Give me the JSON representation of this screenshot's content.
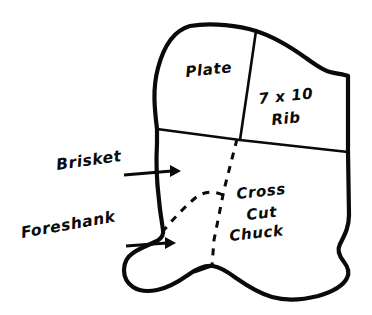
{
  "diagram": {
    "type": "butchery-cut-diagram",
    "colors": {
      "stroke": "#0a0a0a",
      "background": "#ffffff",
      "fill": "#ffffff"
    },
    "inner_labels": [
      {
        "name": "plate",
        "text": "Plate",
        "x": 186,
        "y": 77,
        "rotate": -6
      },
      {
        "name": "rib-line-1",
        "text": "7 x 10",
        "x": 259,
        "y": 104,
        "rotate": -6
      },
      {
        "name": "rib-line-2",
        "text": "Rib",
        "x": 272,
        "y": 125,
        "rotate": -6
      },
      {
        "name": "chuck-line-1",
        "text": "Cross",
        "x": 237,
        "y": 199,
        "rotate": -6
      },
      {
        "name": "chuck-line-2",
        "text": "Cut",
        "x": 247,
        "y": 220,
        "rotate": -6
      },
      {
        "name": "chuck-line-3",
        "text": "Chuck",
        "x": 230,
        "y": 241,
        "rotate": -6
      }
    ],
    "callouts": [
      {
        "name": "brisket",
        "text": "Brisket",
        "text_x": 57,
        "text_y": 170,
        "rotate": -8,
        "arrow_start_x": 124,
        "arrow_start_y": 174,
        "arrow_end_x": 177,
        "arrow_end_y": 172
      },
      {
        "name": "foreshank",
        "text": "Foreshank",
        "text_x": 22,
        "text_y": 238,
        "rotate": -10,
        "arrow_start_x": 126,
        "arrow_start_y": 245,
        "arrow_end_x": 172,
        "arrow_end_y": 244
      }
    ],
    "regions": [
      "Plate",
      "7 x 10 Rib",
      "Cross Cut Chuck",
      "Brisket",
      "Foreshank"
    ]
  }
}
